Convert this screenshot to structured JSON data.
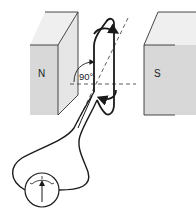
{
  "diagram": {
    "type": "generator-coil-in-magnetic-field",
    "magnet_north": {
      "label": "N"
    },
    "magnet_south": {
      "label": "S"
    },
    "angle": {
      "label": "90°"
    },
    "meter": {
      "name": "galvanometer",
      "icon": "galvanometer-icon"
    },
    "colors": {
      "line": "#1a1a1a",
      "magnet_face": "#d9d9d9",
      "magnet_side": "#e8e8e8",
      "magnet_top": "#efefef",
      "background": "#ffffff"
    }
  }
}
